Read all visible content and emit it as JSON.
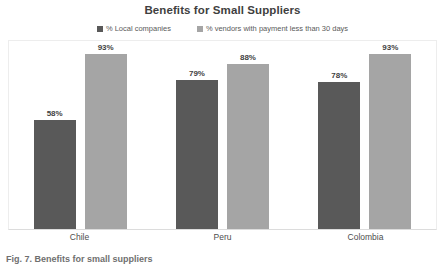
{
  "chart_data": {
    "type": "bar",
    "title": "Benefits for Small Suppliers",
    "xlabel": "",
    "ylabel": "",
    "ylim": [
      0,
      100
    ],
    "grid": false,
    "legend_position": "top-center",
    "categories": [
      "Chile",
      "Peru",
      "Colombia"
    ],
    "series": [
      {
        "name": "% Local companies",
        "color": "#595959",
        "values": [
          58,
          79,
          78
        ],
        "labels": [
          "58%",
          "79%",
          "78%"
        ]
      },
      {
        "name": "% vendors with payment less than 30 days",
        "color": "#a5a5a5",
        "values": [
          93,
          88,
          93
        ],
        "labels": [
          "93%",
          "88%",
          "93%"
        ]
      }
    ]
  },
  "caption": {
    "text": "Fig. 7. Benefits for small suppliers"
  },
  "style": {
    "title_color": "#3f3f3f",
    "label_color": "#4d4d4d",
    "legend_color": "#5a5a5a",
    "plot_border_color": "#ededed",
    "axis_line_color": "#dcdcdc",
    "background": "#ffffff"
  }
}
